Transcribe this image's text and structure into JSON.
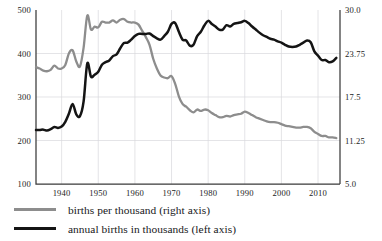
{
  "chart_data": {
    "type": "line",
    "title": "",
    "subtitle": "",
    "xlabel": "",
    "ylabel": "",
    "grid": true,
    "legend_position": "bottom-left",
    "xlim": [
      1933,
      2016
    ],
    "x_ticks": [
      1940,
      1950,
      1960,
      1970,
      1980,
      1990,
      2000,
      2010
    ],
    "x_tick_labels": [
      "1940",
      "1950",
      "1960",
      "1970",
      "1980",
      "1990",
      "2000",
      "2010"
    ],
    "left_axis": {
      "label": "annual births in thousands (left axis)",
      "ylim": [
        100,
        500
      ],
      "ticks": [
        100,
        200,
        300,
        400,
        500
      ],
      "tick_labels": [
        "100",
        "200",
        "300",
        "400",
        "500"
      ]
    },
    "right_axis": {
      "label": "births per thousand (right axis)",
      "ylim": [
        5.0,
        30.0
      ],
      "ticks": [
        5.0,
        11.25,
        17.5,
        23.75,
        30.0
      ],
      "tick_labels": [
        "5.0",
        "11.25",
        "17.5",
        "23.75",
        "30.0"
      ]
    },
    "series": [
      {
        "name": "births per thousand (right axis)",
        "axis": "right",
        "color": "#8d8d8d",
        "x": [
          1933,
          1934,
          1935,
          1936,
          1937,
          1938,
          1939,
          1940,
          1941,
          1942,
          1943,
          1944,
          1945,
          1946,
          1947,
          1948,
          1949,
          1950,
          1951,
          1952,
          1953,
          1954,
          1955,
          1956,
          1957,
          1958,
          1959,
          1960,
          1961,
          1962,
          1963,
          1964,
          1965,
          1966,
          1967,
          1968,
          1969,
          1970,
          1971,
          1972,
          1973,
          1974,
          1975,
          1976,
          1977,
          1978,
          1979,
          1980,
          1981,
          1982,
          1983,
          1984,
          1985,
          1986,
          1987,
          1988,
          1989,
          1990,
          1991,
          1992,
          1993,
          1994,
          1995,
          1996,
          1997,
          1998,
          1999,
          2000,
          2001,
          2002,
          2003,
          2004,
          2005,
          2006,
          2007,
          2008,
          2009,
          2010,
          2011,
          2012,
          2013,
          2014,
          2015
        ],
        "values": [
          21.8,
          21.6,
          21.3,
          21.2,
          21.4,
          22.0,
          21.6,
          21.6,
          22.1,
          23.8,
          24.2,
          22.6,
          21.9,
          24.6,
          29.2,
          27.2,
          27.6,
          27.5,
          28.3,
          28.2,
          28.2,
          28.5,
          28.2,
          28.6,
          28.7,
          28.3,
          28.2,
          28.2,
          27.9,
          27.0,
          26.1,
          25.0,
          23.0,
          21.6,
          20.6,
          20.3,
          20.2,
          20.5,
          19.4,
          17.6,
          16.5,
          16.1,
          15.6,
          15.3,
          15.7,
          15.5,
          15.7,
          15.6,
          15.2,
          14.9,
          14.6,
          14.6,
          14.8,
          14.7,
          14.9,
          15.0,
          15.1,
          15.4,
          15.2,
          14.9,
          14.6,
          14.4,
          14.2,
          14.0,
          13.9,
          13.9,
          13.8,
          13.6,
          13.4,
          13.3,
          13.2,
          13.1,
          13.1,
          13.2,
          13.2,
          13.0,
          12.5,
          12.2,
          11.9,
          11.9,
          11.7,
          11.7,
          11.6
        ]
      },
      {
        "name": "annual births in thousands (left axis)",
        "axis": "left",
        "color": "#141414",
        "x": [
          1933,
          1934,
          1935,
          1936,
          1937,
          1938,
          1939,
          1940,
          1941,
          1942,
          1943,
          1944,
          1945,
          1946,
          1947,
          1948,
          1949,
          1950,
          1951,
          1952,
          1953,
          1954,
          1955,
          1956,
          1957,
          1958,
          1959,
          1960,
          1961,
          1962,
          1963,
          1964,
          1965,
          1966,
          1967,
          1968,
          1969,
          1970,
          1971,
          1972,
          1973,
          1974,
          1975,
          1976,
          1977,
          1978,
          1979,
          1980,
          1981,
          1982,
          1983,
          1984,
          1985,
          1986,
          1987,
          1988,
          1989,
          1990,
          1991,
          1992,
          1993,
          1994,
          1995,
          1996,
          1997,
          1998,
          1999,
          2000,
          2001,
          2002,
          2003,
          2004,
          2005,
          2006,
          2007,
          2008,
          2009,
          2010,
          2011,
          2012,
          2013,
          2014,
          2015
        ],
        "values": [
          224,
          224,
          225,
          223,
          226,
          231,
          229,
          232,
          243,
          262,
          284,
          260,
          256,
          290,
          377,
          347,
          351,
          358,
          374,
          380,
          384,
          394,
          398,
          412,
          424,
          425,
          432,
          440,
          445,
          445,
          445,
          446,
          440,
          435,
          432,
          440,
          450,
          468,
          470,
          450,
          432,
          430,
          418,
          420,
          440,
          450,
          465,
          475,
          468,
          462,
          455,
          455,
          465,
          462,
          468,
          470,
          472,
          475,
          470,
          462,
          455,
          448,
          442,
          438,
          434,
          432,
          428,
          425,
          420,
          416,
          415,
          416,
          420,
          425,
          430,
          426,
          405,
          395,
          385,
          385,
          380,
          382,
          390
        ]
      }
    ]
  },
  "legend": {
    "items": [
      {
        "label": "births per thousand (right axis)",
        "color": "#8d8d8d"
      },
      {
        "label": "annual births in thousands (left axis)",
        "color": "#141414"
      }
    ]
  }
}
